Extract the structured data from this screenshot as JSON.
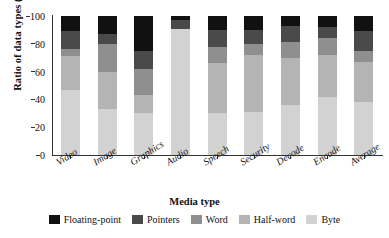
{
  "chart_data": {
    "type": "bar",
    "stacked": true,
    "title": "",
    "xlabel": "Media type",
    "ylabel": "Ratio of data types (%)",
    "ylim": [
      0,
      100
    ],
    "yticks": [
      0,
      20,
      40,
      60,
      80,
      100
    ],
    "grid": false,
    "legend_position": "bottom",
    "categories": [
      "Video",
      "Image",
      "Graphics",
      "Audio",
      "Speech",
      "Security",
      "Decode",
      "Encode",
      "Average"
    ],
    "series": [
      {
        "name": "Byte",
        "color": "#d2d2d2",
        "values": [
          47,
          33,
          30,
          91,
          30,
          31,
          36,
          42,
          38
        ]
      },
      {
        "name": "Half-word",
        "color": "#b4b4b4",
        "values": [
          24,
          27,
          13,
          0,
          36,
          41,
          34,
          30,
          29
        ]
      },
      {
        "name": "Word",
        "color": "#8f8f8f",
        "values": [
          5,
          20,
          19,
          0,
          12,
          8,
          11,
          12,
          8
        ]
      },
      {
        "name": "Pointers",
        "color": "#4a4a4a",
        "values": [
          13,
          7,
          13,
          6,
          12,
          10,
          12,
          8,
          14
        ]
      },
      {
        "name": "Floating-point",
        "color": "#111111",
        "values": [
          11,
          13,
          25,
          3,
          10,
          10,
          7,
          8,
          11
        ]
      }
    ],
    "legend_order": [
      "Floating-point",
      "Pointers",
      "Word",
      "Half-word",
      "Byte"
    ]
  }
}
